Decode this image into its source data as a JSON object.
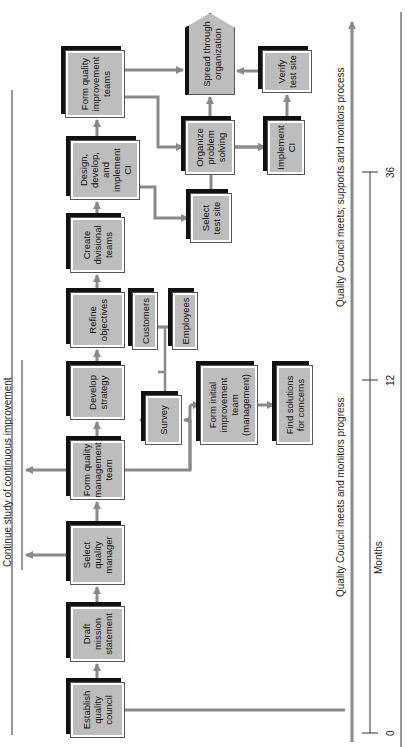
{
  "diagram": {
    "orientation": "rotated-90-ccw",
    "colors": {
      "box_fill": "#bdbdbd",
      "arrow": "#8a8a8a",
      "shadow": "#111111",
      "line": "#333333"
    },
    "boxes": {
      "establish": "Establish quality council",
      "draft": "Draft mission statement",
      "select_manager": "Select quality manager",
      "form_mgmt_team": "Form quality management team",
      "develop_strategy": "Develop strategy",
      "refine_objectives": "Refine objectives",
      "create_divisional": "Create divisional teams",
      "design_ci": "Design, develop, and implement CI",
      "form_qi_teams": "Form quality improvement teams",
      "spread": "Spread through organization",
      "organize": "Organize problem solving",
      "verify": "Verify test site",
      "implement": "Implement CI",
      "select_test_site": "Select test site",
      "customers": "Customers",
      "employees": "Employees",
      "survey": "Survey",
      "form_initial": "Form initial improvement team (management)",
      "find_solutions": "Find solutions for concerns"
    },
    "labels": {
      "continue_study": "Continue study of continuous improvement",
      "council_progress": "Quality Council meets and monitors progress",
      "council_supports": "Quality Council meets; supports and monitors process",
      "months": "Months"
    },
    "timeline": {
      "ticks": [
        "0",
        "12",
        "36"
      ]
    }
  }
}
